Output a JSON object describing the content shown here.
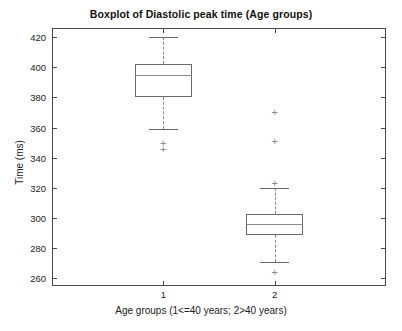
{
  "chart_data": {
    "type": "boxplot",
    "title": "Boxplot of Diastolic peak time (Age groups)",
    "xlabel": "Age groups (1<=40 years; 2>40 years)",
    "ylabel": "Time (ms)",
    "grid": false,
    "legend": "none",
    "ylim": [
      255,
      426
    ],
    "yticks": [
      260,
      280,
      300,
      320,
      340,
      360,
      380,
      400,
      420
    ],
    "ytick_labels": [
      "260",
      "280",
      "300",
      "320",
      "340",
      "360",
      "380",
      "400",
      "420"
    ],
    "xticks": [
      1,
      2
    ],
    "xtick_labels": [
      "1",
      "2"
    ],
    "categories": [
      "1",
      "2"
    ],
    "boxes": [
      {
        "category": "1",
        "x_center": 1,
        "whisker_high": 420,
        "q3": 402,
        "median": 395,
        "q1": 380,
        "whisker_low": 359,
        "outliers": [
          350,
          346
        ]
      },
      {
        "category": "2",
        "x_center": 2,
        "whisker_high": 320,
        "q3": 303,
        "median": 296,
        "q1": 289,
        "whisker_low": 271,
        "outliers": [
          370,
          351,
          323,
          264
        ]
      }
    ]
  },
  "style": {
    "axis_color": "#4a4a4a",
    "box_color": "#6a6a6a",
    "whisker_color": "#8a8a8a",
    "outlier_color": "#8a8a8a",
    "outlier_marker": "+",
    "background": "#ffffff"
  }
}
